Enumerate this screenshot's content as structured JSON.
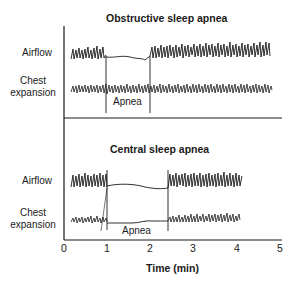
{
  "panels": [
    {
      "title": "Obstructive sleep apnea",
      "rows": [
        {
          "label": "Airflow"
        },
        {
          "label_line1": "Chest",
          "label_line2": "expansion"
        }
      ],
      "apnea_label": "Apnea",
      "apnea_start_min": 1.0,
      "apnea_end_min": 2.0
    },
    {
      "title": "Central sleep apnea",
      "rows": [
        {
          "label": "Airflow"
        },
        {
          "label_line1": "Chest",
          "label_line2": "expansion"
        }
      ],
      "apnea_label": "Apnea",
      "apnea_start_min": 1.0,
      "apnea_end_min": 2.4
    }
  ],
  "axis": {
    "ticks": [
      "0",
      "1",
      "2",
      "3",
      "4",
      "5"
    ],
    "label": "Time (min)"
  }
}
